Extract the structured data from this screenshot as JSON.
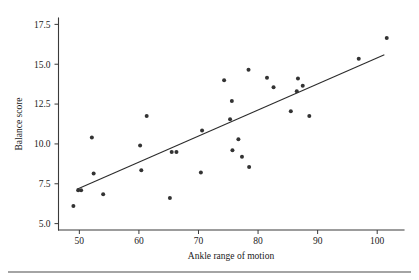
{
  "chart_data": {
    "type": "scatter",
    "title": "",
    "xlabel": "Ankle range of motion",
    "ylabel": "Balance score",
    "xlim": [
      46.5,
      104.5
    ],
    "ylim": [
      4.6,
      17.9
    ],
    "xticks": [
      50,
      60,
      70,
      80,
      90,
      100
    ],
    "xtick_labels": [
      "50",
      "60",
      "70",
      "80",
      "90",
      "100"
    ],
    "yticks": [
      5.0,
      7.5,
      10.0,
      12.5,
      15.0,
      17.5
    ],
    "ytick_labels": [
      "5.0",
      "7.5",
      "10.0",
      "12.5",
      "15.0",
      "17.5"
    ],
    "grid": false,
    "legend": null,
    "points": [
      {
        "x": 49.0,
        "y": 6.1
      },
      {
        "x": 49.8,
        "y": 7.1
      },
      {
        "x": 50.3,
        "y": 7.1
      },
      {
        "x": 52.1,
        "y": 10.4
      },
      {
        "x": 52.4,
        "y": 8.15
      },
      {
        "x": 54.0,
        "y": 6.85
      },
      {
        "x": 60.2,
        "y": 9.9
      },
      {
        "x": 60.4,
        "y": 8.35
      },
      {
        "x": 61.3,
        "y": 11.75
      },
      {
        "x": 65.2,
        "y": 6.6
      },
      {
        "x": 65.5,
        "y": 9.5
      },
      {
        "x": 66.3,
        "y": 9.5
      },
      {
        "x": 70.4,
        "y": 8.2
      },
      {
        "x": 70.6,
        "y": 10.85
      },
      {
        "x": 74.3,
        "y": 14.0
      },
      {
        "x": 75.3,
        "y": 11.55
      },
      {
        "x": 75.6,
        "y": 12.7
      },
      {
        "x": 75.7,
        "y": 9.6
      },
      {
        "x": 76.7,
        "y": 10.3
      },
      {
        "x": 77.3,
        "y": 9.2
      },
      {
        "x": 78.4,
        "y": 14.65
      },
      {
        "x": 78.5,
        "y": 8.55
      },
      {
        "x": 81.5,
        "y": 14.15
      },
      {
        "x": 82.6,
        "y": 13.55
      },
      {
        "x": 85.5,
        "y": 12.05
      },
      {
        "x": 86.5,
        "y": 13.3
      },
      {
        "x": 86.7,
        "y": 14.1
      },
      {
        "x": 87.5,
        "y": 13.65
      },
      {
        "x": 88.6,
        "y": 11.75
      },
      {
        "x": 96.9,
        "y": 15.35
      },
      {
        "x": 101.6,
        "y": 16.65
      }
    ],
    "fit_line": {
      "x0": 49.6,
      "y0": 7.15,
      "x1": 101.2,
      "y1": 15.6
    }
  },
  "figure": {
    "marker_radius": 2.0,
    "marker_color": "#333333",
    "line_color": "#2b2b2b",
    "axis_color": "#3a3a3a",
    "background": "#ffffff"
  }
}
